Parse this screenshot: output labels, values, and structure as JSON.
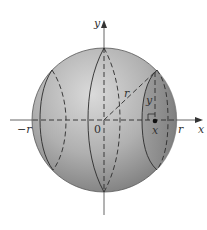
{
  "diagram": {
    "colors": {
      "sphere_light": "#d2d2d2",
      "sphere_mid": "#a8a8a8",
      "sphere_dark": "#7e7e7e",
      "slice": "#8c8c8c",
      "line": "#2b2b2b",
      "axis": "#555555",
      "background": "#ffffff"
    },
    "labels": {
      "y_axis": "y",
      "x_axis": "x",
      "origin": "0",
      "neg_r": "−r",
      "pos_r": "r",
      "radius": "r",
      "slice_height": "y",
      "slice_x": "x"
    }
  }
}
